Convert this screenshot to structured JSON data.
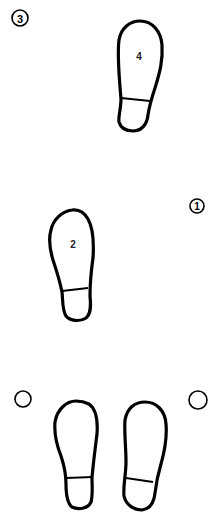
{
  "diagram": {
    "type": "dance-step footprint diagram",
    "background": "#ffffff",
    "stroke_color": "#000000",
    "markers": [
      {
        "id": "marker-3",
        "label": "3",
        "cx": 20,
        "cy": 18,
        "r": 8
      },
      {
        "id": "marker-1",
        "label": "1",
        "cx": 197,
        "cy": 206,
        "r": 7
      },
      {
        "id": "marker-left",
        "label": "",
        "cx": 23,
        "cy": 399,
        "r": 8
      },
      {
        "id": "marker-right",
        "label": "",
        "cx": 198,
        "cy": 400,
        "r": 9
      }
    ],
    "footprints": [
      {
        "id": "footprint-4",
        "label": "4",
        "position": "top-right"
      },
      {
        "id": "footprint-2",
        "label": "2",
        "position": "middle-left"
      },
      {
        "id": "footprint-start-left",
        "label": "",
        "position": "bottom-left"
      },
      {
        "id": "footprint-start-right",
        "label": "",
        "position": "bottom-right"
      }
    ]
  }
}
